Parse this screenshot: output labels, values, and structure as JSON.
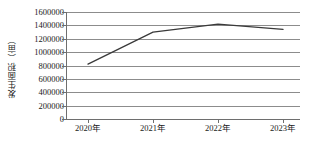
{
  "chart_data": {
    "type": "line",
    "title": "",
    "xlabel": "",
    "ylabel": "发生面积（亩）",
    "categories": [
      "2020年",
      "2021年",
      "2022年",
      "2023年"
    ],
    "values": [
      820000,
      1300000,
      1420000,
      1340000
    ],
    "series": [
      {
        "name": "发生面积",
        "values": [
          820000,
          1300000,
          1420000,
          1340000
        ],
        "color": "#3a3a3a"
      }
    ],
    "ylim": [
      0,
      1600000
    ],
    "ytick_step": 200000,
    "ytick_labels": [
      "1600000",
      "1400000",
      "1200000",
      "1000000",
      "800000",
      "600000",
      "400000",
      "200000",
      "0"
    ],
    "ytick_values": [
      1600000,
      1400000,
      1200000,
      1000000,
      800000,
      600000,
      400000,
      200000,
      0
    ],
    "grid": true,
    "grid_orientation": "horizontal",
    "grid_color": "#8c8c8c",
    "axis_color": "#6e6e6e",
    "legend": false,
    "legend_position": "none",
    "markers": false,
    "background_color": "#ffffff"
  }
}
